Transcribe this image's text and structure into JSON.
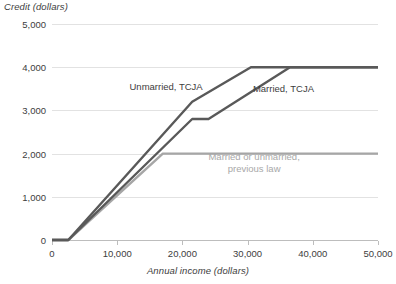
{
  "chart_data": {
    "type": "line",
    "title": "",
    "xlabel": "Annual income (dollars)",
    "ylabel": "Credit (dollars)",
    "xlim": [
      0,
      50000
    ],
    "ylim": [
      0,
      5000
    ],
    "xticks": [
      "0",
      "10,000",
      "20,000",
      "30,000",
      "40,000",
      "50,000"
    ],
    "xtick_values": [
      0,
      10000,
      20000,
      30000,
      40000,
      50000
    ],
    "yticks": [
      "0",
      "1,000",
      "2,000",
      "3,000",
      "4,000",
      "5,000"
    ],
    "ytick_values": [
      0,
      1000,
      2000,
      3000,
      4000,
      5000
    ],
    "grid": "horizontal",
    "legend_position": "inline-annotations",
    "series": [
      {
        "name": "Unmarried, TCJA",
        "color": "#595959",
        "points": [
          [
            0,
            0
          ],
          [
            2500,
            0
          ],
          [
            21500,
            3200
          ],
          [
            30500,
            4000
          ],
          [
            50000,
            4000
          ]
        ]
      },
      {
        "name": "Married, TCJA",
        "color": "#595959",
        "points": [
          [
            0,
            0
          ],
          [
            2500,
            0
          ],
          [
            21500,
            2800
          ],
          [
            24000,
            2800
          ],
          [
            36500,
            4000
          ],
          [
            50000,
            4000
          ]
        ]
      },
      {
        "name": "Married or unmarried, previous law",
        "color": "#a6a6a6",
        "points": [
          [
            0,
            0
          ],
          [
            2500,
            0
          ],
          [
            17000,
            2000
          ],
          [
            50000,
            2000
          ]
        ]
      }
    ],
    "annotations": [
      {
        "text": "Unmarried, TCJA",
        "x": 17500,
        "y": 3550
      },
      {
        "text": "Married, TCJA",
        "x": 35500,
        "y": 3500
      },
      {
        "text": "Married or unmarried,",
        "x": 31000,
        "y": 1780
      },
      {
        "text": "previous law",
        "x": 31000,
        "y": 1520
      }
    ]
  },
  "labels": {
    "y_axis_title": "Credit (dollars)",
    "x_axis_title": "Annual income (dollars)",
    "unmarried_tcja": "Unmarried, TCJA",
    "married_tcja": "Married, TCJA",
    "previous_law_line1": "Married or unmarried,",
    "previous_law_line2": "previous law"
  },
  "colors": {
    "tcja_line": "#595959",
    "previous_law_line": "#a6a6a6",
    "gridline": "#e2e2e2",
    "axis": "#bdbdbd",
    "text": "#3d3d3d",
    "muted_text": "#a8a8a8"
  }
}
